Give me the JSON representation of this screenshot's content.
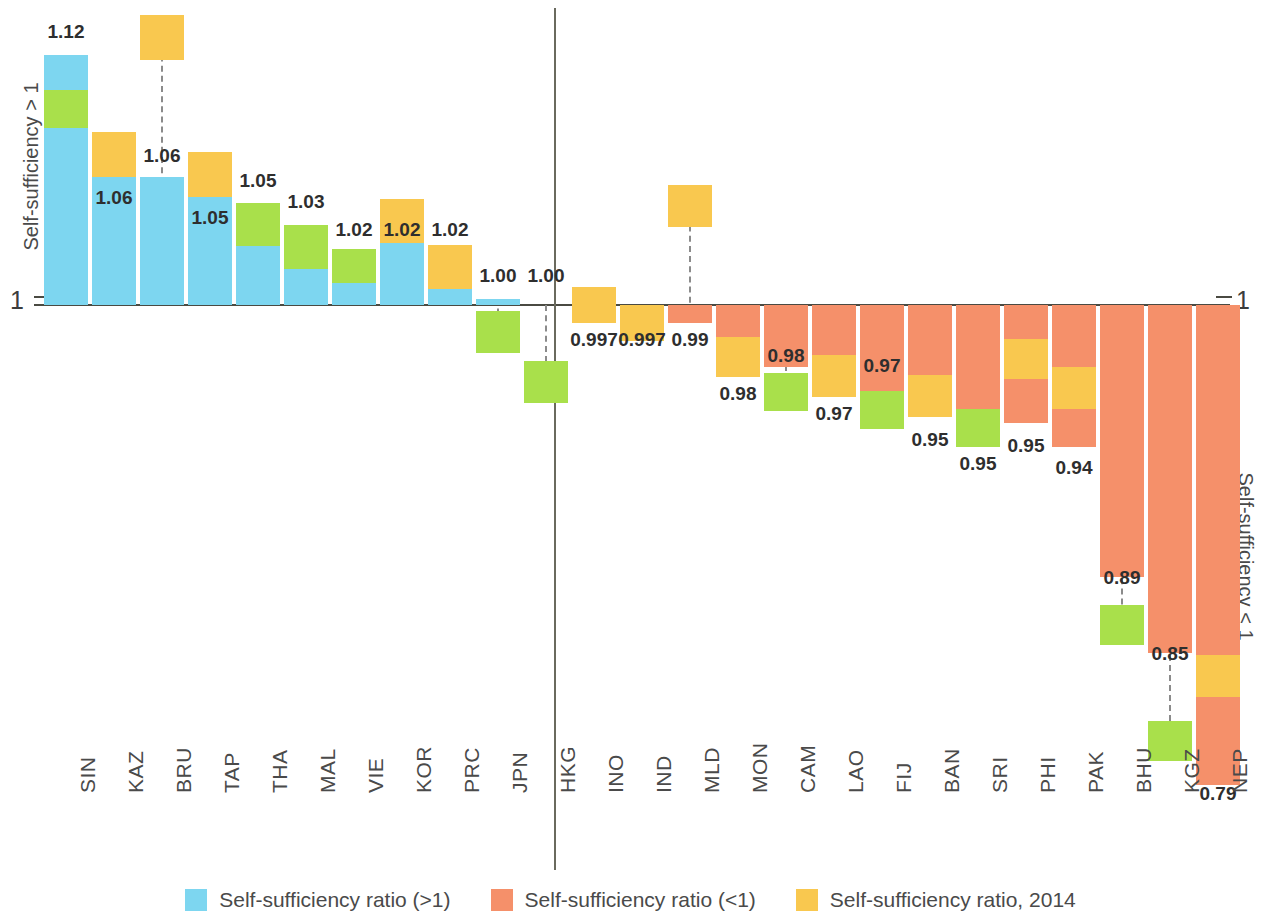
{
  "axis": {
    "left_title": "Self-sufficiency > 1",
    "right_title": "Self-sufficiency < 1",
    "baseline_label_left": "1",
    "baseline_label_right": "1"
  },
  "legend": {
    "items": [
      {
        "label": "Self-sufficiency ratio (>1)",
        "color": "#7DD6F0"
      },
      {
        "label": "Self-sufficiency ratio (<1)",
        "color": "#F5906A"
      },
      {
        "label": "Self-sufficiency ratio, 2014",
        "color": "#F9C84F"
      }
    ]
  },
  "colors": {
    "above_one": "#7DD6F0",
    "below_one": "#F5906A",
    "year_2014": "#F9C84F",
    "marker_green": "#A9E04B",
    "axis": "#4a4a42"
  },
  "chart_data": {
    "type": "bar",
    "title": "",
    "xlabel": "",
    "ylabel": "Self-sufficiency ratio",
    "baseline": 1,
    "grid": false,
    "legend_position": "bottom",
    "categories": [
      "SIN",
      "KAZ",
      "BRU",
      "TAP",
      "THA",
      "MAL",
      "VIE",
      "KOR",
      "PRC",
      "JPN",
      "HKG",
      "INO",
      "IND",
      "MLD",
      "MON",
      "CAM",
      "LAO",
      "FIJ",
      "BAN",
      "SRI",
      "PHI",
      "PAK",
      "BHU",
      "KGZ",
      "NEP"
    ],
    "values": [
      1.12,
      1.06,
      1.06,
      1.05,
      1.05,
      1.03,
      1.02,
      1.02,
      1.02,
      1.0,
      1.0,
      0.997,
      0.997,
      0.99,
      0.98,
      0.98,
      0.97,
      0.97,
      0.95,
      0.95,
      0.95,
      0.94,
      0.89,
      0.85,
      0.79
    ],
    "value_labels": [
      "1.12",
      "1.06",
      "1.06",
      "1.05",
      "1.05",
      "1.03",
      "1.02",
      "1.02",
      "1.02",
      "1.00",
      "1.00",
      "0.997",
      "0.997",
      "0.99",
      "0.98",
      "0.98",
      "0.97",
      "0.97",
      "0.95",
      "0.95",
      "0.95",
      "0.94",
      "0.89",
      "0.85",
      "0.79"
    ],
    "series": [
      {
        "name": "Self-sufficiency ratio (>1)",
        "color": "#7DD6F0"
      },
      {
        "name": "Self-sufficiency ratio (<1)",
        "color": "#F5906A"
      },
      {
        "name": "Self-sufficiency ratio, 2014",
        "color": "#F9C84F"
      }
    ]
  }
}
